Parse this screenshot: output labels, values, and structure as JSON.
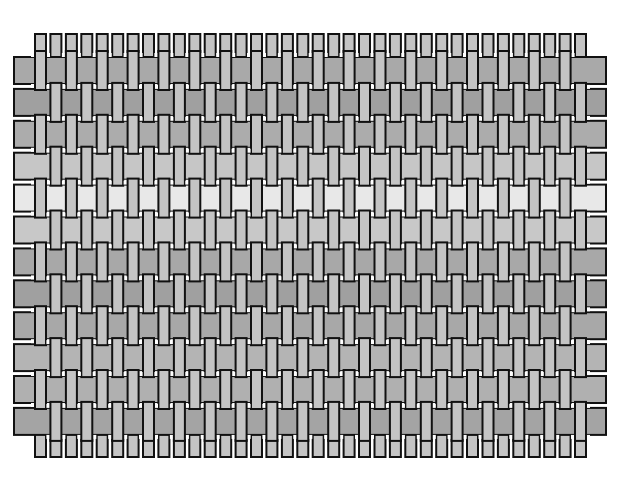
{
  "diagram": {
    "type": "plain-weave",
    "warp": {
      "count": 36,
      "x_start": 35,
      "pitch": 15.43,
      "width": 11,
      "y_top": 34,
      "y_bottom": 457,
      "color": "#c4c4c4"
    },
    "weft": {
      "count": 12,
      "y_start": 57,
      "pitch": 31.9,
      "height": 27,
      "x_left": 14,
      "x_right": 606,
      "row_colors": [
        "#a9a9a9",
        "#a0a0a0",
        "#acacac",
        "#c6c6c6",
        "#e8e8e8",
        "#c8c8c8",
        "#a8a8a8",
        "#a0a0a0",
        "#a8a8a8",
        "#b4b4b4",
        "#b0b0b0",
        "#a4a4a4"
      ]
    },
    "outline_color": "#111111",
    "gap_color": "#ffffff"
  }
}
